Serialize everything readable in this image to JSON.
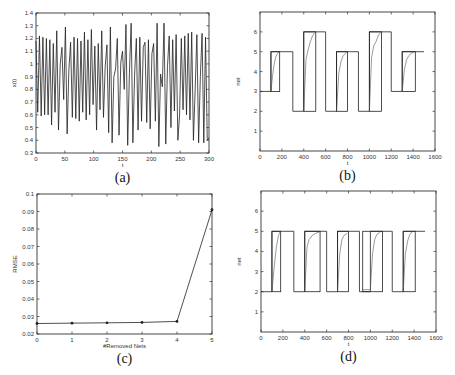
{
  "figure": {
    "panels": [
      "a",
      "b",
      "c",
      "d"
    ]
  },
  "chart_data": [
    {
      "id": "a",
      "type": "line",
      "caption": "(a)",
      "title": "",
      "xlabel": "t",
      "ylabel": "x(t)",
      "xlim": [
        0,
        300
      ],
      "ylim": [
        0.3,
        1.4
      ],
      "xticks": [
        0,
        50,
        100,
        150,
        200,
        250,
        300
      ],
      "yticks": [
        0.3,
        0.4,
        0.5,
        0.6,
        0.7,
        0.8,
        0.9,
        1,
        1.1,
        1.2,
        1.3,
        1.4
      ],
      "ytick_labels": [
        "0.3",
        "0.4",
        "0.5",
        "0.6",
        "0.7",
        "0.8",
        "0.9",
        "1",
        "1.1",
        "1.2",
        "1.3",
        "1.4"
      ],
      "grid": false,
      "frame": {
        "x0": 36,
        "y0": 13,
        "x1": 209,
        "y1": 153
      },
      "series": [
        {
          "name": "x(t)",
          "x": [
            0,
            3,
            6,
            9,
            12,
            15,
            18,
            21,
            24,
            27,
            30,
            33,
            36,
            39,
            42,
            45,
            48,
            51,
            54,
            57,
            60,
            63,
            66,
            69,
            72,
            75,
            78,
            81,
            84,
            87,
            90,
            93,
            96,
            99,
            102,
            105,
            108,
            111,
            114,
            117,
            120,
            123,
            126,
            129,
            132,
            135,
            138,
            141,
            144,
            147,
            150,
            153,
            156,
            159,
            162,
            165,
            168,
            171,
            174,
            177,
            180,
            183,
            186,
            189,
            192,
            195,
            198,
            201,
            204,
            207,
            210,
            213,
            216,
            219,
            222,
            225,
            228,
            231,
            234,
            237,
            240,
            243,
            246,
            249,
            252,
            255,
            258,
            261,
            264,
            267,
            270,
            273,
            276,
            279,
            282,
            285,
            288,
            291,
            294,
            297,
            300
          ],
          "y": [
            1.18,
            0.62,
            1.22,
            0.59,
            1.21,
            0.6,
            1.2,
            0.6,
            1.19,
            0.52,
            1.16,
            0.62,
            1.26,
            0.48,
            1.0,
            1.13,
            0.72,
            1.29,
            0.45,
            0.95,
            1.17,
            0.58,
            1.21,
            0.57,
            1.2,
            0.55,
            1.18,
            0.62,
            1.25,
            0.56,
            1.19,
            0.6,
            1.27,
            0.68,
            1.14,
            0.48,
            1.16,
            0.64,
            1.26,
            0.58,
            0.98,
            1.15,
            0.46,
            1.29,
            0.38,
            0.9,
            0.96,
            1.2,
            0.44,
            1.01,
            1.1,
            0.8,
            1.31,
            0.36,
            0.93,
            1.32,
            0.38,
            0.92,
            1.2,
            0.48,
            1.21,
            0.55,
            1.13,
            1.17,
            0.54,
            1.19,
            0.49,
            1.08,
            1.16,
            0.55,
            1.32,
            0.35,
            0.92,
            0.82,
            1.32,
            0.37,
            0.98,
            1.22,
            0.5,
            1.19,
            0.63,
            1.23,
            0.4,
            0.6,
            1.2,
            0.64,
            1.22,
            0.6,
            1.24,
            0.56,
            1.25,
            0.4,
            0.8,
            1.23,
            0.38,
            0.9,
            1.24,
            0.38,
            1.21,
            0.4,
            0.42
          ]
        }
      ]
    },
    {
      "id": "b",
      "type": "line",
      "caption": "(b)",
      "title": "",
      "xlabel": "t",
      "ylabel": "net",
      "xlim": [
        0,
        1600
      ],
      "ylim": [
        0,
        7
      ],
      "xticks": [
        0,
        200,
        400,
        600,
        800,
        1000,
        1200,
        1400,
        1600
      ],
      "yticks": [
        1,
        2,
        3,
        4,
        5,
        6
      ],
      "ytick_labels": [
        "1",
        "2",
        "3",
        "4",
        "5",
        "6"
      ],
      "grid": false,
      "frame": {
        "x0": 260,
        "y0": 12,
        "x1": 435,
        "y1": 151
      },
      "series": [
        {
          "name": "target",
          "style": "step",
          "x": [
            0,
            100,
            100,
            300,
            300,
            400,
            400,
            600,
            600,
            700,
            700,
            900,
            900,
            1000,
            1000,
            1200,
            1200,
            1300,
            1300,
            1500
          ],
          "y": [
            3,
            3,
            5,
            5,
            2,
            2,
            6,
            6,
            2,
            2,
            5,
            5,
            2,
            2,
            6,
            6,
            3,
            3,
            5,
            5
          ]
        },
        {
          "name": "window-boxes",
          "style": "boxes",
          "boxes": [
            {
              "x0": 100,
              "x1": 180,
              "y0": 3,
              "y1": 5
            },
            {
              "x0": 400,
              "x1": 510,
              "y0": 2,
              "y1": 6
            },
            {
              "x0": 700,
              "x1": 800,
              "y0": 2,
              "y1": 5
            },
            {
              "x0": 1000,
              "x1": 1110,
              "y0": 2,
              "y1": 6
            },
            {
              "x0": 1300,
              "x1": 1420,
              "y0": 3,
              "y1": 5
            }
          ]
        },
        {
          "name": "response",
          "style": "curves",
          "curves": [
            {
              "x": [
                100,
                115,
                130,
                145,
                160,
                175
              ],
              "y": [
                3,
                3.8,
                4.4,
                4.75,
                4.9,
                5
              ]
            },
            {
              "x": [
                400,
                420,
                440,
                460,
                480,
                500
              ],
              "y": [
                2,
                4.6,
                5.1,
                5.5,
                5.8,
                5.95
              ]
            },
            {
              "x": [
                700,
                720,
                740,
                760,
                780,
                795
              ],
              "y": [
                2,
                3.9,
                4.5,
                4.8,
                4.9,
                5
              ]
            },
            {
              "x": [
                1000,
                1020,
                1040,
                1060,
                1080,
                1100
              ],
              "y": [
                2,
                4.7,
                5.3,
                5.5,
                5.8,
                5.95
              ]
            },
            {
              "x": [
                1300,
                1320,
                1340,
                1360,
                1380,
                1410
              ],
              "y": [
                3,
                4.1,
                4.6,
                4.8,
                4.9,
                5
              ]
            }
          ]
        }
      ]
    },
    {
      "id": "c",
      "type": "line",
      "caption": "(c)",
      "title": "",
      "xlabel": "#Removed Nets",
      "ylabel": "RMSE",
      "xlim": [
        0,
        5
      ],
      "ylim": [
        0.02,
        0.1
      ],
      "xticks": [
        0,
        1,
        2,
        3,
        4,
        5
      ],
      "yticks": [
        0.02,
        0.03,
        0.04,
        0.05,
        0.06,
        0.07,
        0.08,
        0.09,
        0.1
      ],
      "ytick_labels": [
        "0.02",
        "0.03",
        "0.04",
        "0.05",
        "0.06",
        "0.07",
        "0.08",
        "0.09",
        "0.1"
      ],
      "grid": false,
      "frame": {
        "x0": 37,
        "y0": 194,
        "x1": 212,
        "y1": 334
      },
      "series": [
        {
          "name": "RMSE",
          "markers": true,
          "x": [
            0,
            1,
            2,
            3,
            4,
            5
          ],
          "y": [
            0.026,
            0.0262,
            0.0264,
            0.0266,
            0.0272,
            0.091
          ]
        }
      ]
    },
    {
      "id": "d",
      "type": "line",
      "caption": "(d)",
      "title": "",
      "xlabel": "t",
      "ylabel": "net",
      "xlim": [
        0,
        1600
      ],
      "ylim": [
        0,
        7
      ],
      "xticks": [
        0,
        200,
        400,
        600,
        800,
        1000,
        1200,
        1400,
        1600
      ],
      "yticks": [
        1,
        2,
        3,
        4,
        5,
        6
      ],
      "ytick_labels": [
        "1",
        "2",
        "3",
        "4",
        "5",
        "6"
      ],
      "grid": false,
      "frame": {
        "x0": 261,
        "y0": 191,
        "x1": 436,
        "y1": 332
      },
      "series": [
        {
          "name": "target",
          "style": "step",
          "x": [
            0,
            100,
            100,
            300,
            300,
            400,
            400,
            600,
            600,
            700,
            700,
            900,
            900,
            1000,
            1000,
            1200,
            1200,
            1300,
            1300,
            1500
          ],
          "y": [
            2,
            2,
            5,
            5,
            2,
            2,
            5,
            5,
            2,
            2,
            5,
            5,
            2,
            2,
            5,
            5,
            2,
            2,
            5,
            5
          ]
        },
        {
          "name": "window-boxes",
          "style": "boxes",
          "boxes": [
            {
              "x0": 100,
              "x1": 180,
              "y0": 2,
              "y1": 5
            },
            {
              "x0": 400,
              "x1": 540,
              "y0": 2,
              "y1": 5
            },
            {
              "x0": 700,
              "x1": 800,
              "y0": 2,
              "y1": 5
            },
            {
              "x0": 930,
              "x1": 1110,
              "y0": 2,
              "y1": 5
            },
            {
              "x0": 1300,
              "x1": 1410,
              "y0": 2,
              "y1": 5
            }
          ]
        },
        {
          "name": "response",
          "style": "curves",
          "curves": [
            {
              "x": [
                100,
                120,
                140,
                160,
                175
              ],
              "y": [
                2,
                3.2,
                4.2,
                4.8,
                5
              ]
            },
            {
              "x": [
                400,
                420,
                440,
                470,
                500,
                530
              ],
              "y": [
                2,
                4.2,
                4.6,
                4.8,
                4.9,
                4.95
              ]
            },
            {
              "x": [
                700,
                720,
                740,
                760,
                790
              ],
              "y": [
                2,
                3.9,
                4.6,
                4.8,
                4.9
              ]
            },
            {
              "x": [
                930,
                1000,
                1020,
                1040,
                1060,
                1090
              ],
              "y": [
                2.1,
                2.1,
                3.9,
                4.6,
                4.85,
                4.95
              ]
            },
            {
              "x": [
                1300,
                1320,
                1340,
                1360,
                1390
              ],
              "y": [
                2,
                3.9,
                4.5,
                4.85,
                5
              ]
            }
          ]
        }
      ]
    }
  ]
}
